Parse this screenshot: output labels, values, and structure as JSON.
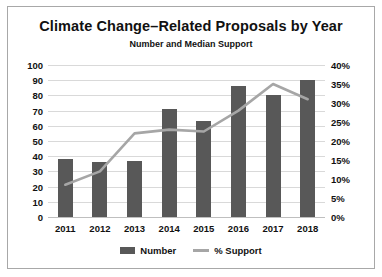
{
  "chart_data": {
    "type": "bar",
    "title": "Climate Change–Related Proposals by Year",
    "subtitle": "Number and Median Support",
    "categories": [
      "2011",
      "2012",
      "2013",
      "2014",
      "2015",
      "2016",
      "2017",
      "2018"
    ],
    "xlabel": "",
    "ylabel": "",
    "ylim": [
      0,
      100
    ],
    "y2lim": [
      0,
      40
    ],
    "yticks": [
      "0",
      "10",
      "20",
      "30",
      "40",
      "50",
      "60",
      "70",
      "80",
      "90",
      "100"
    ],
    "y2ticks": [
      "0%",
      "5%",
      "10%",
      "15%",
      "20%",
      "25%",
      "30%",
      "35%",
      "40%"
    ],
    "grid": true,
    "legend_position": "bottom",
    "series": [
      {
        "name": "Number",
        "type": "bar",
        "axis": "left",
        "color": "#585858",
        "values": [
          38,
          36,
          37,
          71,
          63,
          86,
          80,
          90
        ]
      },
      {
        "name": "% Support",
        "type": "line",
        "axis": "right",
        "color": "#a6a6a6",
        "values": [
          8.5,
          12,
          22,
          23,
          22.5,
          28,
          35,
          31
        ]
      }
    ]
  },
  "legend": {
    "items": [
      {
        "label": "Number",
        "marker": "bar-swatch"
      },
      {
        "label": "% Support",
        "marker": "line-swatch"
      }
    ]
  }
}
